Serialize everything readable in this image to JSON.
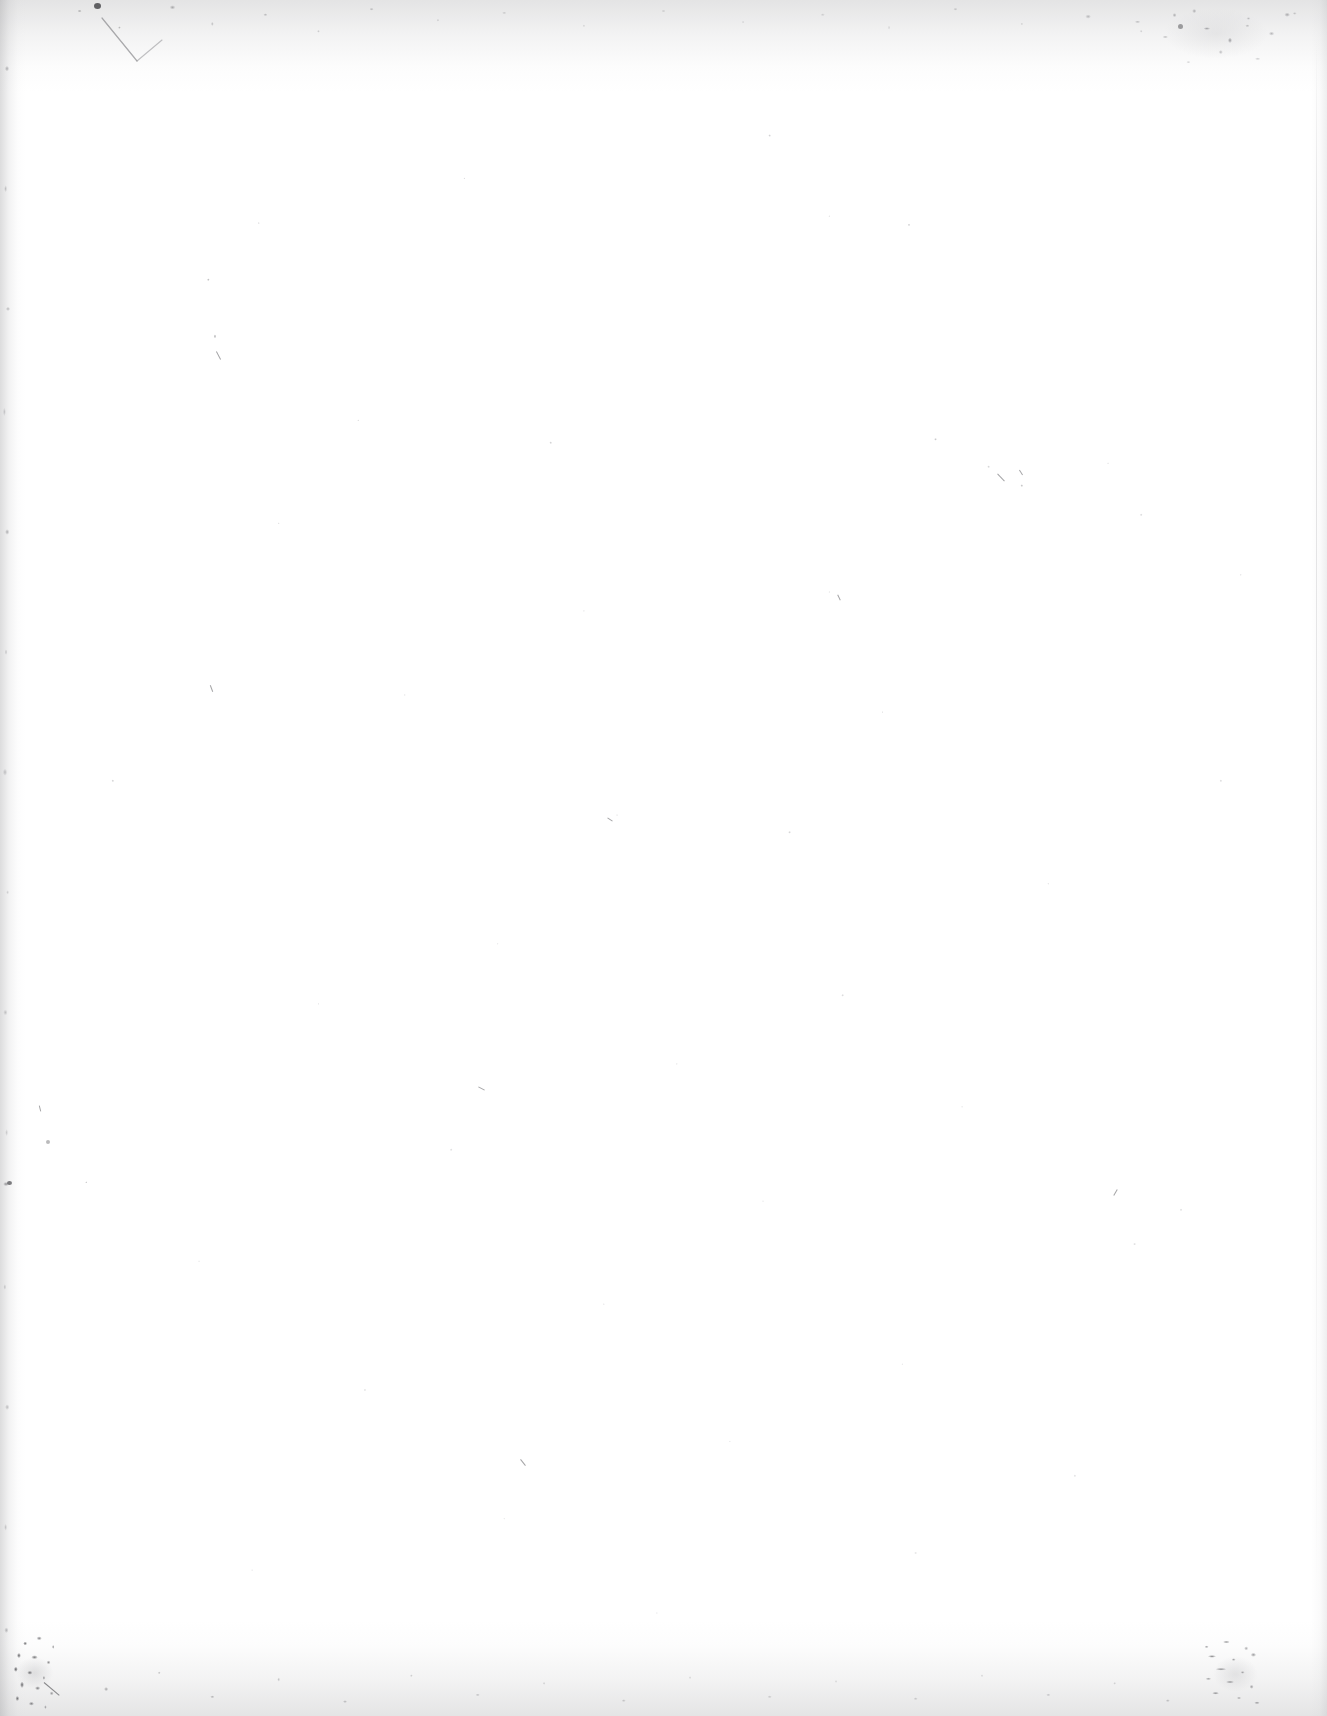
{
  "page": {
    "kind": "scanned-blank-page",
    "content_text": "",
    "width_px": 1327,
    "height_px": 1716,
    "background_color": "#ffffff",
    "paper_tone": "#ffffff",
    "artifact_color": "#6e6e72",
    "edge_shadow_color": "#9a9a9d"
  },
  "artifacts": {
    "edge_top_label": "top-edge-speckle-band",
    "edge_bottom_label": "bottom-edge-speckle-band",
    "edge_left_label": "left-edge-shadow-streak",
    "edge_right_label": "right-edge-shadow",
    "corner_bl_label": "bottom-left-dirt-cluster",
    "corner_br_label": "bottom-right-dirt-smudge",
    "smudge_tr_label": "top-right-mottled-smudge",
    "pencil_mark_label": "faint-v-shaped-line-mark",
    "speck_field_label": "scattered-dust-specks"
  }
}
